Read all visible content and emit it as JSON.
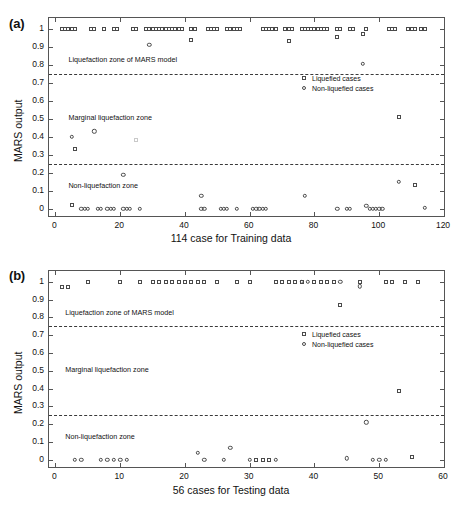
{
  "figure": {
    "panels": [
      {
        "tag": "(a)",
        "xlabel": "114 case for Training data",
        "ylabel": "MARS output"
      },
      {
        "tag": "(b)",
        "xlabel": "56 cases for Testing data",
        "ylabel": "MARS output"
      }
    ],
    "legend": {
      "liquefied": "Liquefied cases",
      "non_liquefied": "Non-liquefied cases",
      "symbol_liquefied": "square-marker-icon",
      "symbol_non_liquefied": "circle-marker-icon"
    },
    "zones": {
      "upper": "Liquefaction zone of MARS model",
      "middle": "Marginal liquefaction zone",
      "lower": "Non-liquefaction zone"
    },
    "colors": {
      "marker": "#4a4a4a",
      "axis": "#555555",
      "threshold": "#3a3a3a",
      "text": "#111111"
    }
  },
  "chart_data": [
    {
      "type": "scatter",
      "panel": "(a)",
      "title": "",
      "xlabel": "114 case for Training data",
      "ylabel": "MARS output",
      "xlim": [
        -2,
        120
      ],
      "ylim": [
        -0.04,
        1.06
      ],
      "xticks": [
        0,
        20,
        40,
        60,
        80,
        100,
        120
      ],
      "yticks": [
        0,
        0.1,
        0.2,
        0.3,
        0.4,
        0.5,
        0.6,
        0.7,
        0.8,
        0.9,
        1
      ],
      "grid": false,
      "legend_position": "right-upper-inside",
      "thresholds": [
        {
          "value": 0.75,
          "style": "dashed",
          "label": "upper decision boundary"
        },
        {
          "value": 0.25,
          "style": "dashed",
          "label": "lower decision boundary"
        }
      ],
      "annotations": [
        {
          "text": "Liquefaction zone of MARS model",
          "x": 4,
          "y": 0.825
        },
        {
          "text": "Marginal liquefaction zone",
          "x": 4,
          "y": 0.505
        },
        {
          "text": "Non-liquefaction zone",
          "x": 4,
          "y": 0.128
        }
      ],
      "series": [
        {
          "name": "Liquefied cases",
          "marker": "square",
          "points": [
            [
              2,
              1
            ],
            [
              3,
              1
            ],
            [
              4,
              1
            ],
            [
              5,
              1
            ],
            [
              6,
              1
            ],
            [
              6,
              0.33
            ],
            [
              5,
              0.02
            ],
            [
              11,
              1
            ],
            [
              12,
              1
            ],
            [
              15,
              1
            ],
            [
              18,
              1
            ],
            [
              19,
              1
            ],
            [
              25,
              0.38
            ],
            [
              24,
              1
            ],
            [
              25,
              1
            ],
            [
              28,
              1
            ],
            [
              29,
              1
            ],
            [
              30,
              1
            ],
            [
              31,
              1
            ],
            [
              32,
              1
            ],
            [
              33,
              1
            ],
            [
              34,
              1
            ],
            [
              35,
              1
            ],
            [
              36,
              1
            ],
            [
              37,
              1
            ],
            [
              38,
              1
            ],
            [
              39,
              1
            ],
            [
              42,
              0.94
            ],
            [
              42,
              1
            ],
            [
              43,
              1
            ],
            [
              47,
              1
            ],
            [
              48,
              1
            ],
            [
              49,
              1
            ],
            [
              50,
              1
            ],
            [
              53,
              1
            ],
            [
              54,
              1
            ],
            [
              55,
              1
            ],
            [
              56,
              1
            ],
            [
              57,
              1
            ],
            [
              64,
              1
            ],
            [
              65,
              1
            ],
            [
              66,
              1
            ],
            [
              67,
              1
            ],
            [
              68,
              1
            ],
            [
              72,
              0.93
            ],
            [
              71,
              1
            ],
            [
              72,
              1
            ],
            [
              73,
              1
            ],
            [
              76,
              1
            ],
            [
              77,
              1
            ],
            [
              78,
              1
            ],
            [
              79,
              1
            ],
            [
              80,
              1
            ],
            [
              81,
              1
            ],
            [
              82,
              1
            ],
            [
              83,
              1
            ],
            [
              84,
              1
            ],
            [
              87,
              0.955
            ],
            [
              87,
              1
            ],
            [
              88,
              1
            ],
            [
              91,
              1
            ],
            [
              92,
              1
            ],
            [
              95,
              0.97
            ],
            [
              96,
              1
            ],
            [
              106,
              0.51
            ],
            [
              103,
              1
            ],
            [
              104,
              1
            ],
            [
              105,
              1
            ],
            [
              109,
              1
            ],
            [
              110,
              1
            ],
            [
              111,
              1
            ],
            [
              111,
              0.13
            ],
            [
              113,
              1
            ],
            [
              114,
              1
            ]
          ]
        },
        {
          "name": "Non-liquefied cases",
          "marker": "circle",
          "points": [
            [
              5,
              0.4
            ],
            [
              12,
              0.43
            ],
            [
              21,
              0.19
            ],
            [
              29,
              0.91
            ],
            [
              45,
              0.073
            ],
            [
              77,
              0.073
            ],
            [
              95,
              0.805
            ],
            [
              106,
              0.15
            ],
            [
              8,
              0
            ],
            [
              9,
              0
            ],
            [
              10,
              0
            ],
            [
              13,
              0
            ],
            [
              14,
              0
            ],
            [
              16,
              0
            ],
            [
              17,
              0
            ],
            [
              18,
              0
            ],
            [
              21,
              0
            ],
            [
              22,
              0
            ],
            [
              23,
              0
            ],
            [
              26,
              0
            ],
            [
              45,
              0
            ],
            [
              46,
              0
            ],
            [
              51,
              0
            ],
            [
              52,
              0
            ],
            [
              53,
              0
            ],
            [
              56,
              0
            ],
            [
              61,
              0
            ],
            [
              62,
              0
            ],
            [
              63,
              0
            ],
            [
              64,
              0
            ],
            [
              65,
              0
            ],
            [
              87,
              0
            ],
            [
              90,
              0
            ],
            [
              91,
              0
            ],
            [
              96,
              0.018
            ],
            [
              97,
              0
            ],
            [
              98,
              0
            ],
            [
              99,
              0
            ],
            [
              100,
              0
            ],
            [
              101,
              0
            ],
            [
              114,
              0.005
            ]
          ]
        }
      ]
    },
    {
      "type": "scatter",
      "panel": "(b)",
      "title": "",
      "xlabel": "56 cases for Testing data",
      "ylabel": "MARS output",
      "xlim": [
        -1,
        60
      ],
      "ylim": [
        -0.04,
        1.06
      ],
      "xticks": [
        0,
        10,
        20,
        30,
        40,
        50,
        60
      ],
      "yticks": [
        0,
        0.1,
        0.2,
        0.3,
        0.4,
        0.5,
        0.6,
        0.7,
        0.8,
        0.9,
        1
      ],
      "grid": false,
      "legend_position": "right-upper-inside",
      "thresholds": [
        {
          "value": 0.75,
          "style": "dashed",
          "label": "upper decision boundary"
        },
        {
          "value": 0.25,
          "style": "dashed",
          "label": "lower decision boundary"
        }
      ],
      "annotations": [
        {
          "text": "Liquefaction zone of MARS model",
          "x": 1.5,
          "y": 0.825
        },
        {
          "text": "Marginal liquefaction zone",
          "x": 1.5,
          "y": 0.505
        },
        {
          "text": "Non-liquefaction zone",
          "x": 1.5,
          "y": 0.128
        }
      ],
      "series": [
        {
          "name": "Liquefied cases",
          "marker": "square",
          "points": [
            [
              1,
              0.97
            ],
            [
              2,
              0.97
            ],
            [
              5,
              1
            ],
            [
              10,
              1
            ],
            [
              13,
              1
            ],
            [
              15,
              1
            ],
            [
              16,
              1
            ],
            [
              17,
              1
            ],
            [
              18,
              1
            ],
            [
              19,
              1
            ],
            [
              20,
              1
            ],
            [
              21,
              1
            ],
            [
              22,
              1
            ],
            [
              23,
              1
            ],
            [
              25,
              1
            ],
            [
              28,
              1
            ],
            [
              30,
              1
            ],
            [
              34,
              1
            ],
            [
              35,
              1
            ],
            [
              36,
              1
            ],
            [
              37,
              1
            ],
            [
              38,
              1
            ],
            [
              40,
              1
            ],
            [
              41,
              1
            ],
            [
              42,
              1
            ],
            [
              43,
              1
            ],
            [
              44,
              0.87
            ],
            [
              47,
              1
            ],
            [
              51,
              1
            ],
            [
              52,
              1
            ],
            [
              53,
              0.385
            ],
            [
              54,
              1
            ],
            [
              56,
              1
            ],
            [
              31,
              0
            ],
            [
              32,
              0
            ],
            [
              33,
              0
            ],
            [
              55,
              0.018
            ]
          ]
        },
        {
          "name": "Non-liquefied cases",
          "marker": "circle",
          "points": [
            [
              22,
              0.04
            ],
            [
              27,
              0.068
            ],
            [
              48,
              0.21
            ],
            [
              38,
              1
            ],
            [
              39,
              1
            ],
            [
              44,
              1
            ],
            [
              47,
              0.975
            ],
            [
              3,
              0
            ],
            [
              4,
              0
            ],
            [
              7,
              0
            ],
            [
              8,
              0
            ],
            [
              9,
              0
            ],
            [
              10,
              0
            ],
            [
              11,
              0
            ],
            [
              23,
              0
            ],
            [
              26,
              0
            ],
            [
              30,
              0
            ],
            [
              34,
              0
            ],
            [
              45,
              0.008
            ],
            [
              49,
              0
            ],
            [
              50,
              0
            ],
            [
              51,
              0
            ]
          ]
        }
      ]
    }
  ]
}
